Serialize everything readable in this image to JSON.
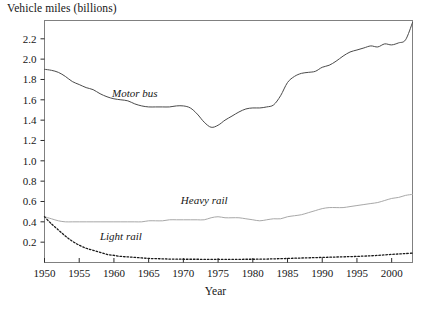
{
  "chart_data": {
    "type": "line",
    "title": "",
    "ylabel": "Vehicle miles (billions)",
    "xlabel": "Year",
    "xlim": [
      1950,
      2003
    ],
    "ylim": [
      0,
      2.38
    ],
    "grid": false,
    "legend_position": "inline-annotations",
    "xticks": [
      1950,
      1955,
      1960,
      1965,
      1970,
      1975,
      1980,
      1985,
      1990,
      1995,
      2000
    ],
    "xtick_labels": [
      "1950",
      "1955",
      "1960",
      "1965",
      "1970",
      "1975",
      "1980",
      "1985",
      "1990",
      "1995",
      "2000"
    ],
    "yticks": [
      0.2,
      0.4,
      0.6,
      0.8,
      1.0,
      1.2,
      1.4,
      1.6,
      1.8,
      2.0,
      2.2
    ],
    "ytick_labels": [
      "0.2",
      "0.4",
      "0.6",
      "0.8",
      "1.0",
      "1.2",
      "1.4",
      "1.6",
      "1.8",
      "2.0",
      "2.2"
    ],
    "x": [
      1950,
      1951,
      1952,
      1953,
      1954,
      1955,
      1956,
      1957,
      1958,
      1959,
      1960,
      1961,
      1962,
      1963,
      1964,
      1965,
      1966,
      1967,
      1968,
      1969,
      1970,
      1971,
      1972,
      1973,
      1974,
      1975,
      1976,
      1977,
      1978,
      1979,
      1980,
      1981,
      1982,
      1983,
      1984,
      1985,
      1986,
      1987,
      1988,
      1989,
      1990,
      1991,
      1992,
      1993,
      1994,
      1995,
      1996,
      1997,
      1998,
      1999,
      2000,
      2001,
      2002,
      2003
    ],
    "series": [
      {
        "name": "Motor bus",
        "style": "solid",
        "color": "#4a4a4a",
        "label_x": 1963,
        "label_y": 1.63,
        "values": [
          1.9,
          1.89,
          1.87,
          1.83,
          1.78,
          1.75,
          1.72,
          1.7,
          1.66,
          1.63,
          1.61,
          1.6,
          1.59,
          1.56,
          1.54,
          1.53,
          1.53,
          1.53,
          1.53,
          1.54,
          1.54,
          1.52,
          1.46,
          1.38,
          1.33,
          1.35,
          1.4,
          1.44,
          1.48,
          1.51,
          1.52,
          1.52,
          1.53,
          1.55,
          1.64,
          1.77,
          1.83,
          1.86,
          1.87,
          1.88,
          1.92,
          1.94,
          1.98,
          2.03,
          2.07,
          2.09,
          2.11,
          2.13,
          2.12,
          2.15,
          2.14,
          2.16,
          2.19,
          2.36
        ]
      },
      {
        "name": "Heavy rail",
        "style": "solid",
        "color": "#a8a8a8",
        "label_x": 1973,
        "label_y": 0.58,
        "values": [
          0.45,
          0.43,
          0.41,
          0.4,
          0.4,
          0.4,
          0.4,
          0.4,
          0.4,
          0.4,
          0.4,
          0.4,
          0.4,
          0.4,
          0.4,
          0.41,
          0.41,
          0.41,
          0.42,
          0.42,
          0.42,
          0.42,
          0.42,
          0.42,
          0.44,
          0.45,
          0.44,
          0.44,
          0.44,
          0.43,
          0.42,
          0.41,
          0.42,
          0.43,
          0.43,
          0.45,
          0.46,
          0.47,
          0.49,
          0.51,
          0.53,
          0.54,
          0.54,
          0.54,
          0.55,
          0.56,
          0.57,
          0.58,
          0.59,
          0.61,
          0.63,
          0.64,
          0.66,
          0.67
        ]
      },
      {
        "name": "Light rail",
        "style": "dotted",
        "color": "#1a1a1a",
        "label_x": 1961,
        "label_y": 0.22,
        "values": [
          0.45,
          0.38,
          0.32,
          0.26,
          0.21,
          0.17,
          0.14,
          0.12,
          0.1,
          0.08,
          0.07,
          0.06,
          0.055,
          0.05,
          0.045,
          0.04,
          0.038,
          0.036,
          0.034,
          0.033,
          0.032,
          0.032,
          0.032,
          0.031,
          0.031,
          0.031,
          0.031,
          0.031,
          0.031,
          0.032,
          0.032,
          0.033,
          0.034,
          0.036,
          0.038,
          0.04,
          0.042,
          0.044,
          0.046,
          0.048,
          0.05,
          0.052,
          0.054,
          0.056,
          0.058,
          0.06,
          0.063,
          0.066,
          0.07,
          0.075,
          0.08,
          0.084,
          0.088,
          0.092
        ]
      }
    ]
  },
  "frame": {
    "border_color": "#808080"
  }
}
